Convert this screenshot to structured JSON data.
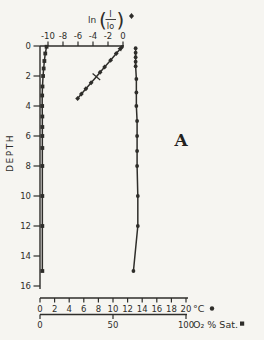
{
  "figure": {
    "panel_label": "A",
    "ink_color": "#2e2d2a",
    "background_color": "#f6f5f1",
    "depth_axis": {
      "label": "DEPTH",
      "ticks": [
        0,
        2,
        4,
        6,
        8,
        10,
        12,
        14,
        16
      ],
      "min": 0,
      "max": 16,
      "direction": "down"
    },
    "light_axis": {
      "label_function": "ln",
      "numerator": "I",
      "denominator": "Io",
      "marker_icon": "diamond",
      "ticks": [
        -10,
        -8,
        -6,
        -4,
        -2,
        0
      ],
      "min": -10,
      "max": 0,
      "position": "top"
    },
    "temp_axis": {
      "label": "°C",
      "marker_icon": "circle",
      "ticks": [
        0,
        2,
        4,
        6,
        8,
        10,
        12,
        14,
        16,
        18,
        20
      ],
      "min": 0,
      "max": 20,
      "position": "bottom"
    },
    "oxygen_axis": {
      "label": "O₂ % Sat.",
      "marker_icon": "square",
      "ticks": [
        0,
        50,
        100
      ],
      "min": 0,
      "max": 100,
      "position": "bottom"
    }
  },
  "chart_data": {
    "type": "line",
    "annotation": "A",
    "depth_label": "DEPTH",
    "depth_range": [
      0,
      16
    ],
    "depth_positive_down": true,
    "grid": false,
    "axes": {
      "light": {
        "label": "ln(I/Io)",
        "range": [
          -10,
          0
        ],
        "position": "top"
      },
      "temp": {
        "label": "°C",
        "range": [
          0,
          20
        ],
        "position": "bottom"
      },
      "oxygen": {
        "label": "O₂ % Sat.",
        "range": [
          0,
          100
        ],
        "position": "bottom"
      }
    },
    "series": [
      {
        "name": "light_attenuation",
        "legend": "ln(I/Io)",
        "axis": "light",
        "marker": "diamond",
        "arrow_end": true,
        "points": [
          {
            "depth": 0.1,
            "value": -0.2
          },
          {
            "depth": 0.5,
            "value": -0.9
          },
          {
            "depth": 0.95,
            "value": -1.65
          },
          {
            "depth": 1.4,
            "value": -2.45
          },
          {
            "depth": 1.75,
            "value": -3.05
          },
          {
            "depth": 2.05,
            "value": -3.55,
            "marker": "tick"
          },
          {
            "depth": 2.45,
            "value": -4.25
          },
          {
            "depth": 2.85,
            "value": -4.95
          },
          {
            "depth": 3.2,
            "value": -5.55
          },
          {
            "depth": 3.5,
            "value": -6.05
          }
        ]
      },
      {
        "name": "temperature",
        "legend": "°C",
        "axis": "temp",
        "marker": "circle",
        "points": [
          {
            "depth": 0.15,
            "value": 13.1
          },
          {
            "depth": 0.45,
            "value": 13.1
          },
          {
            "depth": 0.75,
            "value": 13.1
          },
          {
            "depth": 1.05,
            "value": 13.1
          },
          {
            "depth": 1.35,
            "value": 13.1
          },
          {
            "depth": 2.2,
            "value": 13.2
          },
          {
            "depth": 3.1,
            "value": 13.2
          },
          {
            "depth": 4.0,
            "value": 13.2
          },
          {
            "depth": 5.0,
            "value": 13.3
          },
          {
            "depth": 6.0,
            "value": 13.3
          },
          {
            "depth": 7.0,
            "value": 13.3
          },
          {
            "depth": 8.0,
            "value": 13.3
          },
          {
            "depth": 10.0,
            "value": 13.4
          },
          {
            "depth": 12.0,
            "value": 13.4
          },
          {
            "depth": 15.0,
            "value": 12.8
          }
        ]
      },
      {
        "name": "oxygen_saturation",
        "legend": "O₂ % Sat.",
        "axis": "oxygen",
        "marker": "square",
        "points": [
          {
            "depth": 0.05,
            "value": 4.5
          },
          {
            "depth": 0.5,
            "value": 3.6
          },
          {
            "depth": 1.0,
            "value": 3.0
          },
          {
            "depth": 1.5,
            "value": 2.5
          },
          {
            "depth": 2.0,
            "value": 2.1
          },
          {
            "depth": 2.7,
            "value": 1.7
          },
          {
            "depth": 3.3,
            "value": 1.5
          },
          {
            "depth": 4.0,
            "value": 1.5
          },
          {
            "depth": 4.7,
            "value": 1.6
          },
          {
            "depth": 5.4,
            "value": 1.6
          },
          {
            "depth": 6.0,
            "value": 1.6
          },
          {
            "depth": 6.8,
            "value": 1.6
          },
          {
            "depth": 8.0,
            "value": 1.6
          },
          {
            "depth": 10.0,
            "value": 1.6
          },
          {
            "depth": 12.0,
            "value": 1.6
          },
          {
            "depth": 15.0,
            "value": 1.6
          }
        ]
      }
    ]
  }
}
